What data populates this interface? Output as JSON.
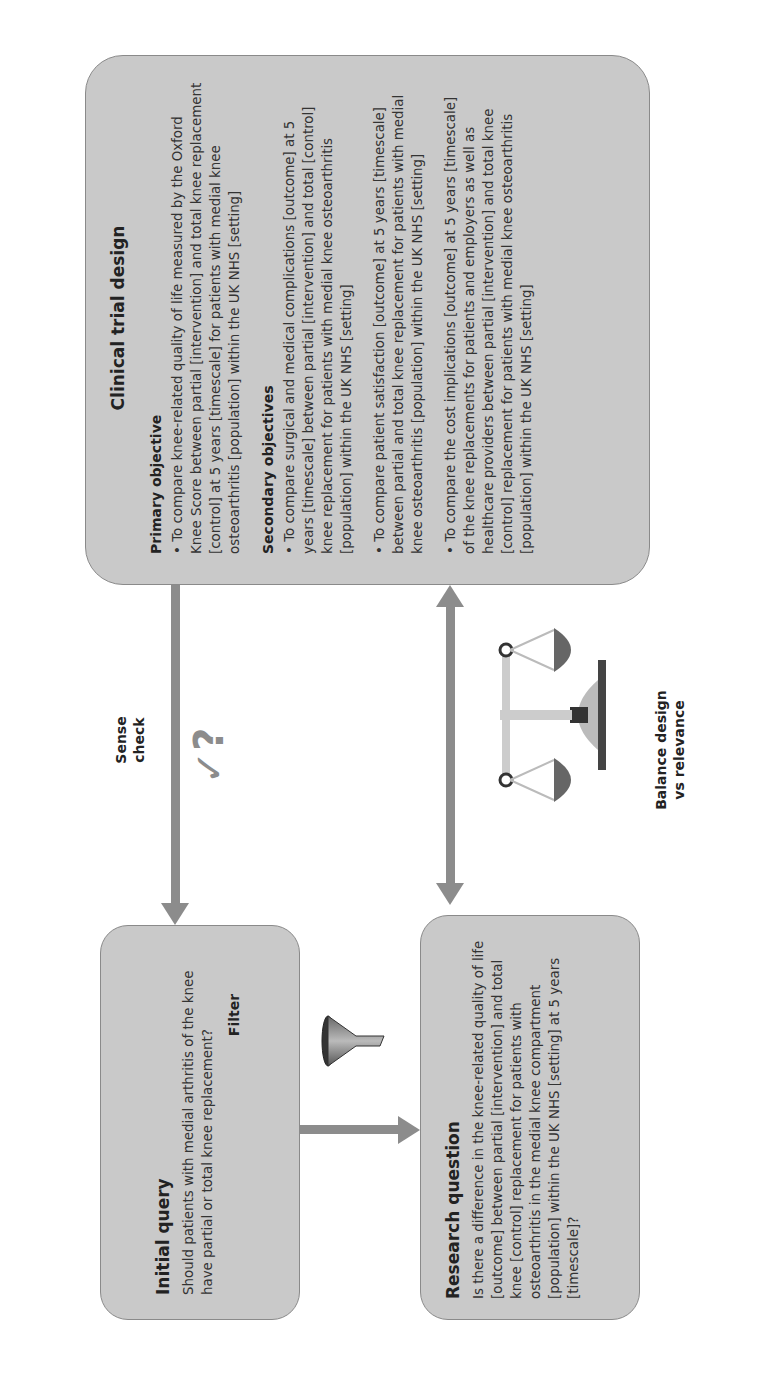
{
  "orientation": "rotated -90deg (landscape figure displayed in portrait)",
  "initial_query": {
    "title": "Initial query",
    "text": "Should patients with medial arthritis of the knee have partial or total knee replacement?"
  },
  "research_question": {
    "title": "Research question",
    "text": "Is there a difference in the knee-related quality of life [outcome] between partial [intervention] and total knee [control] replacement for patients with osteoarthritis in the medial knee compartment [population] within the UK NHS [setting] at 5 years [timescale]?"
  },
  "clinical_trial_design": {
    "title": "Clinical trial design",
    "primary_heading": "Primary objective",
    "primary_objective": "• To compare knee-related quality of life measured by the Oxford Knee Score between partial [intervention] and total knee replacement [control] at 5 years [timescale] for patients with medial knee osteoarthritis [population] within the UK NHS [setting]",
    "secondary_heading": "Secondary objectives",
    "secondary_objectives": [
      "• To compare surgical and medical complications [outcome] at 5 years [timescale] between partial [intervention] and total [control] knee replacement for patients with medial knee osteoarthritis [population] within the UK NHS [setting]",
      "• To compare patient satisfaction [outcome] at 5 years [timescale] between partial and total knee replacement for patients with medial knee osteoarthritis [population] within the UK NHS [setting]",
      "• To compare the cost implications [outcome] at 5 years [timescale] of the knee replacements for patients and employers as well as healthcare providers between partial [intervention] and total knee [control] replacement for patients with medial knee osteoarthritis [population] within the UK NHS [setting]"
    ]
  },
  "connectors": {
    "filter_label": "Filter",
    "sense_check_label": "Sense check",
    "sense_check_glyph": "✓?",
    "balance_label": "Balance design vs relevance"
  },
  "colors": {
    "box_fill": "#c9c9c9",
    "box_border": "#8a8a8a",
    "arrow": "#8c8c8c"
  }
}
